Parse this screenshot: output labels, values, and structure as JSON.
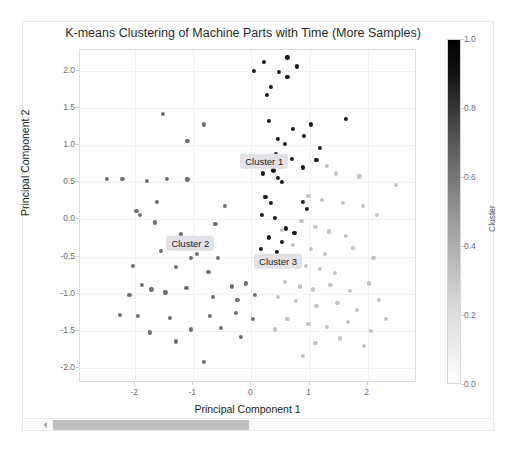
{
  "top_strip": {
    "faint_text": ""
  },
  "figure": {
    "title": "K-means Clustering of Machine Parts with Time (More Samples)"
  },
  "colorbar": {
    "label": "Cluster",
    "ticks": [
      "0.0",
      "0.2",
      "0.4",
      "0.6",
      "0.8",
      "1.0"
    ],
    "min": 0.0,
    "max": 1.0,
    "colormap": "grayscale-white-to-black"
  },
  "annotations": [
    {
      "text": "Cluster 1",
      "x": 0.22,
      "y": 0.78
    },
    {
      "text": "Cluster 2",
      "x": -1.05,
      "y": -0.32
    },
    {
      "text": "Cluster 3",
      "x": 0.46,
      "y": -0.56
    }
  ],
  "scrollbar": {
    "orientation": "horizontal",
    "thumb_fraction": 0.42
  },
  "chart_data": {
    "type": "scatter",
    "title": "K-means Clustering of Machine Parts with Time (More Samples)",
    "xlabel": "Principal Component 1",
    "ylabel": "Principal Component 2",
    "xlim": [
      -2.95,
      2.85
    ],
    "ylim": [
      -2.2,
      2.28
    ],
    "xticks": [
      -2,
      -1,
      0,
      1,
      2
    ],
    "yticks": [
      -2.0,
      -1.5,
      -1.0,
      -0.5,
      0.0,
      0.5,
      1.0,
      1.5,
      2.0
    ],
    "grid": true,
    "legend": "colorbar",
    "colorbar_label": "Cluster",
    "marker_size_px": 4.2,
    "series": [
      {
        "name": "Cluster 1",
        "color": "#1a1a1a",
        "points": [
          [
            0.22,
            2.12
          ],
          [
            0.62,
            2.18
          ],
          [
            0.78,
            2.06
          ],
          [
            0.05,
            2.0
          ],
          [
            0.48,
            1.98
          ],
          [
            0.62,
            1.92
          ],
          [
            0.34,
            1.78
          ],
          [
            0.26,
            1.68
          ],
          [
            0.3,
            1.33
          ],
          [
            1.62,
            1.35
          ],
          [
            1.02,
            1.28
          ],
          [
            0.72,
            1.22
          ],
          [
            0.9,
            1.12
          ],
          [
            0.46,
            1.08
          ],
          [
            0.58,
            1.02
          ],
          [
            1.18,
            0.96
          ],
          [
            0.42,
            0.88
          ],
          [
            0.3,
            0.84
          ],
          [
            0.7,
            0.82
          ],
          [
            0.56,
            0.76
          ],
          [
            1.12,
            0.8
          ],
          [
            0.38,
            0.66
          ],
          [
            0.2,
            0.62
          ],
          [
            0.88,
            0.7
          ],
          [
            0.46,
            0.56
          ],
          [
            0.52,
            0.5
          ],
          [
            0.24,
            0.3
          ],
          [
            0.34,
            0.22
          ],
          [
            0.88,
            0.24
          ],
          [
            0.96,
            0.14
          ],
          [
            0.18,
            0.06
          ],
          [
            0.4,
            0.02
          ],
          [
            0.6,
            -0.12
          ],
          [
            0.74,
            -0.18
          ],
          [
            0.3,
            -0.24
          ],
          [
            0.52,
            -0.3
          ],
          [
            0.44,
            -0.44
          ],
          [
            0.16,
            -0.4
          ]
        ]
      },
      {
        "name": "Cluster 2",
        "color": "#6e6e76",
        "points": [
          [
            -1.52,
            1.42
          ],
          [
            -0.82,
            1.28
          ],
          [
            -1.1,
            1.06
          ],
          [
            -2.48,
            0.55
          ],
          [
            -2.22,
            0.55
          ],
          [
            -1.8,
            0.52
          ],
          [
            -1.46,
            0.55
          ],
          [
            -1.1,
            0.54
          ],
          [
            -1.62,
            0.24
          ],
          [
            -1.98,
            0.12
          ],
          [
            -1.92,
            0.06
          ],
          [
            -1.66,
            -0.04
          ],
          [
            -0.62,
            -0.06
          ],
          [
            -1.22,
            -0.2
          ],
          [
            -0.88,
            -0.26
          ],
          [
            -1.34,
            -0.34
          ],
          [
            -1.56,
            -0.42
          ],
          [
            -0.94,
            -0.46
          ],
          [
            -1.04,
            -0.52
          ],
          [
            -0.58,
            -0.52
          ],
          [
            -1.3,
            -0.64
          ],
          [
            -0.74,
            -0.7
          ],
          [
            -1.88,
            -0.88
          ],
          [
            -1.72,
            -0.94
          ],
          [
            -1.48,
            -0.98
          ],
          [
            -1.12,
            -0.92
          ],
          [
            -0.34,
            -0.9
          ],
          [
            -0.1,
            -0.86
          ],
          [
            -2.1,
            -1.02
          ],
          [
            -0.66,
            -1.04
          ],
          [
            -0.24,
            -1.08
          ],
          [
            0.06,
            -1.02
          ],
          [
            -2.26,
            -1.28
          ],
          [
            -1.96,
            -1.3
          ],
          [
            -1.4,
            -1.32
          ],
          [
            -0.72,
            -1.3
          ],
          [
            -0.26,
            -1.26
          ],
          [
            0.02,
            -1.34
          ],
          [
            -1.74,
            -1.52
          ],
          [
            -1.04,
            -1.48
          ],
          [
            -0.52,
            -1.46
          ],
          [
            -0.18,
            -1.58
          ],
          [
            -0.82,
            -1.92
          ],
          [
            -1.3,
            -1.64
          ],
          [
            -2.04,
            -0.62
          ],
          [
            -0.46,
            0.18
          ]
        ]
      },
      {
        "name": "Cluster 3",
        "color": "#c2c2c8",
        "points": [
          [
            1.3,
            0.72
          ],
          [
            1.46,
            0.62
          ],
          [
            0.98,
            0.32
          ],
          [
            1.22,
            0.26
          ],
          [
            1.58,
            0.22
          ],
          [
            1.92,
            0.18
          ],
          [
            2.48,
            0.46
          ],
          [
            2.16,
            0.06
          ],
          [
            0.86,
            -0.02
          ],
          [
            1.1,
            -0.1
          ],
          [
            1.34,
            -0.16
          ],
          [
            1.62,
            -0.22
          ],
          [
            0.72,
            -0.34
          ],
          [
            1.02,
            -0.4
          ],
          [
            1.26,
            -0.46
          ],
          [
            1.74,
            -0.38
          ],
          [
            0.66,
            -0.58
          ],
          [
            0.94,
            -0.62
          ],
          [
            1.18,
            -0.66
          ],
          [
            1.44,
            -0.72
          ],
          [
            0.58,
            -0.84
          ],
          [
            0.84,
            -0.9
          ],
          [
            1.06,
            -0.94
          ],
          [
            1.36,
            -0.88
          ],
          [
            1.7,
            -0.96
          ],
          [
            2.02,
            -0.86
          ],
          [
            0.46,
            -1.04
          ],
          [
            0.76,
            -1.1
          ],
          [
            1.12,
            -1.16
          ],
          [
            1.48,
            -1.12
          ],
          [
            1.82,
            -1.22
          ],
          [
            2.2,
            -1.08
          ],
          [
            0.62,
            -1.34
          ],
          [
            0.98,
            -1.4
          ],
          [
            1.3,
            -1.44
          ],
          [
            1.66,
            -1.38
          ],
          [
            2.06,
            -1.5
          ],
          [
            0.4,
            -1.48
          ],
          [
            1.1,
            -1.66
          ],
          [
            1.52,
            -1.6
          ],
          [
            0.88,
            -1.84
          ],
          [
            1.94,
            -1.7
          ],
          [
            2.32,
            -1.34
          ],
          [
            0.52,
            -0.14
          ],
          [
            1.86,
            0.58
          ],
          [
            2.1,
            -0.52
          ]
        ]
      }
    ]
  }
}
